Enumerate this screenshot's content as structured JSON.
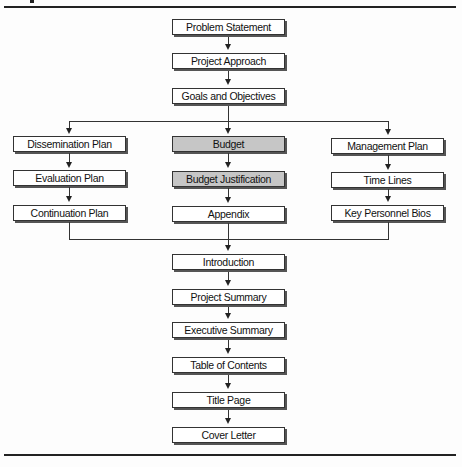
{
  "diagram": {
    "type": "flowchart",
    "colors": {
      "box_fill": "#ffffff",
      "highlight_fill": "#c6c6c6",
      "line": "#333333"
    },
    "top_chain": [
      {
        "id": "problem-statement",
        "label": "Problem Statement"
      },
      {
        "id": "project-approach",
        "label": "Project Approach"
      },
      {
        "id": "goals-objectives",
        "label": "Goals and Objectives"
      }
    ],
    "left_branch": [
      {
        "id": "dissemination-plan",
        "label": "Dissemination Plan"
      },
      {
        "id": "evaluation-plan",
        "label": "Evaluation Plan"
      },
      {
        "id": "continuation-plan",
        "label": "Continuation Plan"
      }
    ],
    "middle_branch": [
      {
        "id": "budget",
        "label": "Budget",
        "highlighted": true
      },
      {
        "id": "budget-justification",
        "label": "Budget Justification",
        "highlighted": true
      },
      {
        "id": "appendix",
        "label": "Appendix",
        "highlighted": false
      }
    ],
    "right_branch": [
      {
        "id": "management-plan",
        "label": "Management Plan"
      },
      {
        "id": "time-lines",
        "label": "Time Lines"
      },
      {
        "id": "key-personnel-bios",
        "label": "Key Personnel Bios"
      }
    ],
    "bottom_chain": [
      {
        "id": "introduction",
        "label": "Introduction"
      },
      {
        "id": "project-summary",
        "label": "Project Summary"
      },
      {
        "id": "executive-summary",
        "label": "Executive Summary"
      },
      {
        "id": "table-of-contents",
        "label": "Table of Contents"
      },
      {
        "id": "title-page",
        "label": "Title Page"
      },
      {
        "id": "cover-letter",
        "label": "Cover Letter"
      }
    ]
  }
}
